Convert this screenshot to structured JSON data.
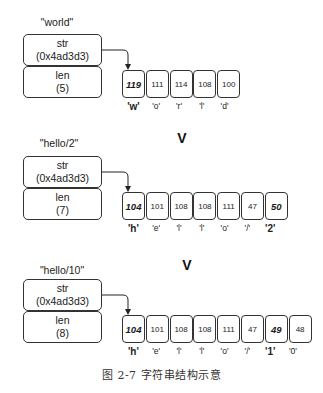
{
  "diagrams": [
    {
      "title": "\"world\"",
      "str_label": "str",
      "str_value": "(0x4ad3d3)",
      "len_label": "len",
      "len_value": "(5)",
      "bytes": [
        "119",
        "111",
        "114",
        "108",
        "100"
      ],
      "chars": [
        "'w'",
        "'o'",
        "'r'",
        "'l'",
        "'d'"
      ],
      "highlight": [
        0
      ]
    },
    {
      "title": "\"hello/2\"",
      "str_label": "str",
      "str_value": "(0x4ad3d3)",
      "len_label": "len",
      "len_value": "(7)",
      "bytes": [
        "104",
        "101",
        "108",
        "108",
        "111",
        "47",
        "50"
      ],
      "chars": [
        "'h'",
        "'e'",
        "'l'",
        "'l'",
        "'o'",
        "'/'",
        "'2'"
      ],
      "highlight": [
        0,
        6
      ]
    },
    {
      "title": "\"hello/10\"",
      "str_label": "str",
      "str_value": "(0x4ad3d3)",
      "len_label": "len",
      "len_value": "(8)",
      "bytes": [
        "104",
        "101",
        "108",
        "108",
        "111",
        "47",
        "49",
        "48"
      ],
      "chars": [
        "'h'",
        "'e'",
        "'l'",
        "'l'",
        "'o'",
        "'/'",
        "'1'",
        "'0'"
      ],
      "highlight": [
        0,
        6
      ]
    }
  ],
  "transitions": [
    "V",
    "V"
  ],
  "caption": "图 2-7    字符串结构示意"
}
